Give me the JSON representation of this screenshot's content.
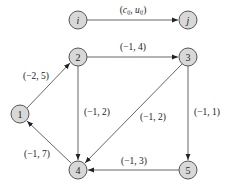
{
  "diagram": {
    "type": "directed-network",
    "legend": {
      "from": "i",
      "to": "j",
      "label": "(c_ij, u_ij)"
    },
    "colors": {
      "node_fill": "#d8d8d8",
      "stroke": "#555555",
      "text": "#222222"
    },
    "nodes": [
      {
        "id": "1",
        "label": "1"
      },
      {
        "id": "2",
        "label": "2"
      },
      {
        "id": "3",
        "label": "3"
      },
      {
        "id": "4",
        "label": "4"
      },
      {
        "id": "5",
        "label": "5"
      }
    ],
    "edges": [
      {
        "from": "1",
        "to": "2",
        "label": "(−2, 5)"
      },
      {
        "from": "2",
        "to": "3",
        "label": "(−1, 4)"
      },
      {
        "from": "2",
        "to": "4",
        "label": "(−1, 2)"
      },
      {
        "from": "3",
        "to": "4",
        "label": "(−1, 2)"
      },
      {
        "from": "3",
        "to": "5",
        "label": "(−1, 1)"
      },
      {
        "from": "5",
        "to": "4",
        "label": "(−1, 3)"
      },
      {
        "from": "4",
        "to": "1",
        "label": "(−1, 7)"
      }
    ]
  }
}
